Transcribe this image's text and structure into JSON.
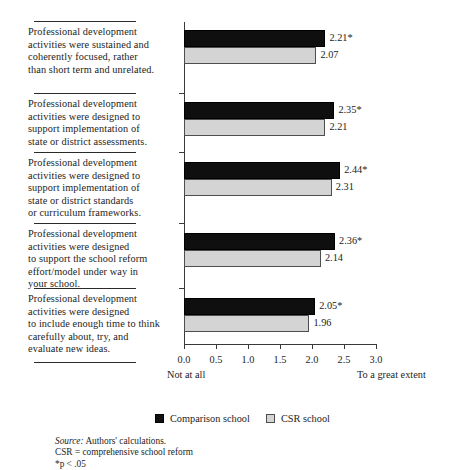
{
  "chart_data": {
    "type": "bar",
    "orientation": "horizontal",
    "title": "",
    "xlabel": "",
    "ylabel": "",
    "xlim": [
      0.0,
      3.0
    ],
    "grid": false,
    "legend_position": "bottom",
    "tick_labels": [
      "0.0",
      "0.5",
      "1.0",
      "1.5",
      "2.0",
      "2.5",
      "3.0"
    ],
    "tick_values": [
      0.0,
      0.5,
      1.0,
      1.5,
      2.0,
      2.5,
      3.0
    ],
    "scale_anchor_low": "Not at all",
    "scale_anchor_high": "To a great extent",
    "categories": [
      "Professional development activities were sustained and coherently focused, rather than short term and unrelated.",
      "Professional development activities were designed to support implementation of state or district assessments.",
      "Professional development activities were designed to support implementation of state or district standards or curriculum frameworks.",
      "Professional development activities were designed to support the school reform effort/model under way in your school.",
      "Professional development activities were designed to include enough time to think carefully about, try, and evaluate new ideas."
    ],
    "category_lines": [
      [
        "Professional development",
        "activities were sustained and",
        "coherently focused, rather",
        "than short term and unrelated."
      ],
      [
        "Professional development",
        "activities were designed to",
        "support implementation of",
        "state or district assessments."
      ],
      [
        "Professional development",
        "activities were designed to",
        "support implementation of",
        "state or district standards",
        "or curriculum frameworks."
      ],
      [
        "Professional development",
        "activities were designed",
        "to support the school reform",
        "effort/model under way in",
        "your school."
      ],
      [
        "Professional development",
        "activities were designed",
        "to include enough time to think",
        "carefully about, try, and",
        "evaluate new ideas."
      ]
    ],
    "series": [
      {
        "name": "Comparison school",
        "color": "#111111",
        "values": [
          2.21,
          2.35,
          2.44,
          2.36,
          2.05
        ],
        "labels": [
          "2.21*",
          "2.35*",
          "2.44*",
          "2.36*",
          "2.05*"
        ]
      },
      {
        "name": "CSR school",
        "color": "#d4d4d4",
        "values": [
          2.07,
          2.21,
          2.31,
          2.14,
          1.96
        ],
        "labels": [
          "2.07",
          "2.21",
          "2.31",
          "2.14",
          "1.96"
        ]
      }
    ],
    "notes": [
      "Source: Authors' calculations.",
      "CSR = comprehensive school reform",
      "*p < .05"
    ],
    "note_source_prefix": "Source:",
    "note_source_rest": " Authors' calculations.",
    "note_csr": "CSR = comprehensive school reform",
    "note_p": "*p < .05"
  },
  "legend": {
    "comparison_label": "Comparison school",
    "csr_label": "CSR school"
  }
}
